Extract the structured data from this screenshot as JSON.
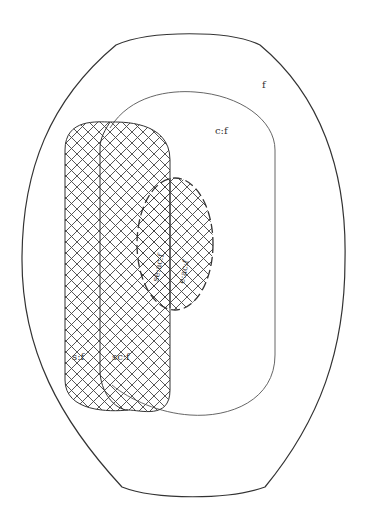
{
  "diagram": {
    "type": "nested set diagram",
    "labels": {
      "outer": "f",
      "middle": "c:f",
      "left_strip": "s:f",
      "center_strip": "sc:f",
      "dashed_left": "se:ac:f",
      "dashed_right": "e:ac:f"
    },
    "colors": {
      "stroke": "#333333",
      "hatch": "#444444",
      "background": "#ffffff"
    },
    "regions": [
      {
        "id": "f",
        "shape": "barrel-oval",
        "style": "solid"
      },
      {
        "id": "c:f",
        "shape": "rounded-rect",
        "style": "thin solid"
      },
      {
        "id": "s:f",
        "shape": "rounded-strip",
        "style": "cross-hatched"
      },
      {
        "id": "sc:f",
        "shape": "rounded-strip",
        "style": "cross-hatched"
      },
      {
        "id": "ac:f",
        "shape": "ellipse",
        "style": "dashed, cross-hatched"
      }
    ]
  }
}
